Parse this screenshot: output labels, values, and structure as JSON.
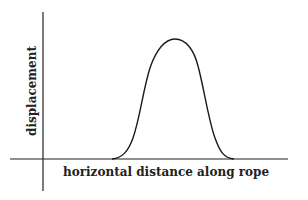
{
  "diagram": {
    "title": "",
    "y_axis_label": "displacement",
    "x_axis_label": "horizontal distance along rope",
    "colors": {
      "ink": "#1a1a1a",
      "background": "#ffffff"
    },
    "shape": "single symmetric pulse (bell-shaped) on a rope"
  }
}
